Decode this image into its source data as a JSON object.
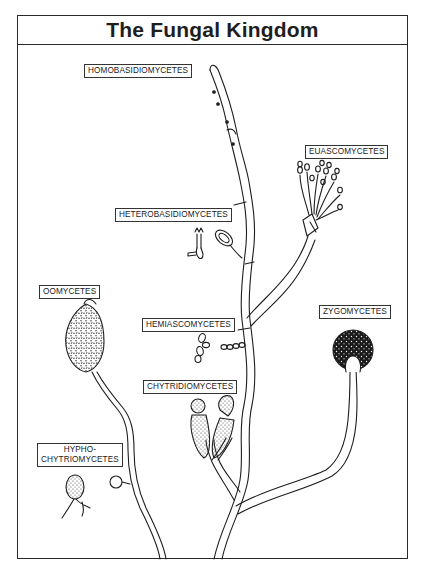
{
  "title": "The Fungal Kingdom",
  "labels": {
    "homobasidiomycetes": "HOMOBASIDIOMYCETES",
    "euascomycetes": "EUASCOMYCETES",
    "heterobasidiomycetes": "HETEROBASIDIOMYCETES",
    "oomycetes": "OOMYCETES",
    "hemiascomycetes": "HEMIASCOMYCETES",
    "zygomycetes": "ZYGOMYCETES",
    "chytridiomycetes": "CHYTRIDIOMYCETES",
    "hyphochytriomycetes_line1": "HYPHO-",
    "hyphochytriomycetes_line2": "CHYTRIOMYCETES"
  },
  "colors": {
    "ink": "#1e1e1e",
    "background": "#ffffff"
  }
}
